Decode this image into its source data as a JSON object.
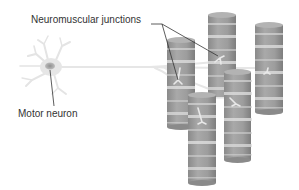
{
  "diagram": {
    "labels": {
      "neuromuscular_junctions": "Neuromuscular junctions",
      "motor_neuron": "Motor neuron"
    },
    "colors": {
      "background": "#ffffff",
      "muscle_fiber": "#a0a0a0",
      "muscle_fiber_dark": "#8c8c8c",
      "striation": "#d8d8d8",
      "neuron": "#e6e6e6",
      "nucleus": "#a8a8a8",
      "leader_line": "#333333",
      "label_text": "#333333"
    },
    "muscle_fibers": [
      {
        "id": "fiber-1",
        "x": 167,
        "top": 40,
        "bottom": 127,
        "width": 28
      },
      {
        "id": "fiber-2",
        "x": 208,
        "top": 15,
        "bottom": 97,
        "width": 28
      },
      {
        "id": "fiber-3",
        "x": 255,
        "top": 25,
        "bottom": 112,
        "width": 28
      },
      {
        "id": "fiber-4",
        "x": 224,
        "top": 72,
        "bottom": 160,
        "width": 27
      },
      {
        "id": "fiber-5",
        "x": 188,
        "top": 95,
        "bottom": 183,
        "width": 28
      }
    ]
  }
}
